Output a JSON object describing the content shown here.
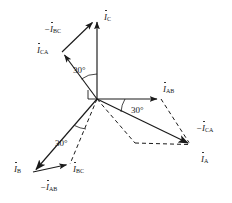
{
  "figure": {
    "type": "phasor-diagram",
    "background_color": "#ffffff",
    "stroke_color": "#1a1a1a",
    "origin": {
      "x": 97,
      "y": 99
    }
  },
  "labels": {
    "i_c": {
      "prefix": "",
      "symbol": "I",
      "sub": "C",
      "x": 104,
      "y": 13
    },
    "minus_i_bc": {
      "prefix": "−",
      "symbol": "I",
      "sub": "BC",
      "x": 44,
      "y": 25
    },
    "i_ca": {
      "prefix": "",
      "symbol": "I",
      "sub": "CA",
      "x": 37,
      "y": 46
    },
    "i_ab": {
      "prefix": "",
      "symbol": "I",
      "sub": "AB",
      "x": 163,
      "y": 85
    },
    "minus_i_ca": {
      "prefix": "−",
      "symbol": "I",
      "sub": "CA",
      "x": 196,
      "y": 124
    },
    "i_a": {
      "prefix": "",
      "symbol": "I",
      "sub": "A",
      "x": 201,
      "y": 155
    },
    "i_b": {
      "prefix": "",
      "symbol": "I",
      "sub": "B",
      "x": 14,
      "y": 165
    },
    "minus_i_ab": {
      "prefix": "−",
      "symbol": "I",
      "sub": "AB",
      "x": 40,
      "y": 183
    },
    "i_bc": {
      "prefix": "",
      "symbol": "I",
      "sub": "BC",
      "x": 73,
      "y": 165
    }
  },
  "angles": [
    {
      "name": "angle-top",
      "text": "30°",
      "x": 73,
      "y": 66
    },
    {
      "name": "angle-right",
      "text": "30°",
      "x": 131,
      "y": 106
    },
    {
      "name": "angle-bottom",
      "text": "30°",
      "x": 55,
      "y": 139
    }
  ],
  "vectors": {
    "i_c": {
      "from": [
        97,
        99
      ],
      "to": [
        97,
        18
      ],
      "style": "solid"
    },
    "i_ca": {
      "from": [
        97,
        99
      ],
      "to": [
        62,
        52
      ],
      "style": "solid"
    },
    "minus_i_bc": {
      "from": [
        62,
        52
      ],
      "to": [
        94,
        20
      ],
      "style": "solid"
    },
    "i_ab": {
      "from": [
        97,
        99
      ],
      "to": [
        161,
        99
      ],
      "style": "solid"
    },
    "minus_i_ca": {
      "from": [
        161,
        99
      ],
      "to": [
        192,
        145
      ],
      "style": "dashed"
    },
    "i_a": {
      "from": [
        97,
        99
      ],
      "to": [
        192,
        145
      ],
      "style": "solid"
    },
    "i_b": {
      "from": [
        97,
        99
      ],
      "to": [
        33,
        172
      ],
      "style": "solid"
    },
    "minus_i_ab": {
      "from": [
        33,
        172
      ],
      "to": [
        70,
        164
      ],
      "style": "solid"
    },
    "i_bc": {
      "from": [
        97,
        99
      ],
      "to": [
        70,
        164
      ],
      "style": "dashed"
    },
    "dash_a_helper": {
      "from": [
        97,
        99
      ],
      "to": [
        135,
        143
      ],
      "style": "dashed"
    },
    "dash_a_base": {
      "from": [
        135,
        143
      ],
      "to": [
        192,
        145
      ],
      "style": "dashed"
    }
  }
}
